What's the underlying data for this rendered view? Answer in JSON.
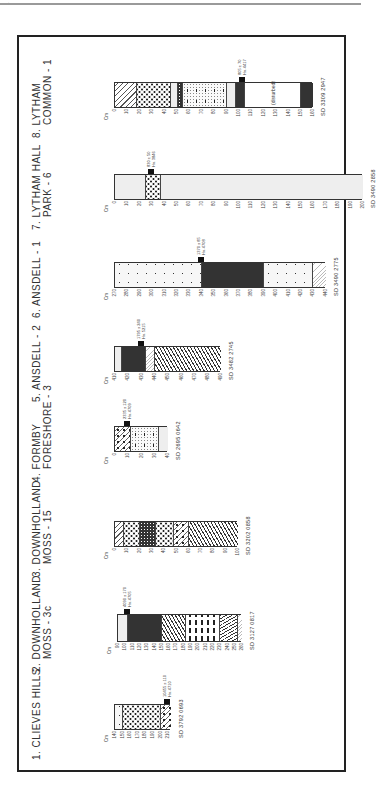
{
  "page": {
    "page_mark": "·"
  },
  "figure": {
    "type": "stratigraphic-columns",
    "depth_unit": "Cm",
    "sites": [
      {
        "number": "1.",
        "name_line1": "CLIEVES HILLS",
        "name_line2": "",
        "grid_ref": "SD 3792 0693",
        "depth_ticks": [
          "140",
          "150",
          "160",
          "170",
          "180",
          "190",
          "200",
          "210"
        ],
        "date": {
          "age": "10455 ± 110",
          "lab": "Hv. 4710"
        },
        "layers": [
          {
            "from": 140,
            "to": 150,
            "pattern": "dots"
          },
          {
            "from": 150,
            "to": 200,
            "pattern": "circles"
          },
          {
            "from": 200,
            "to": 214,
            "pattern": "mixed"
          }
        ]
      },
      {
        "number": "2.",
        "name_line1": "DOWNHOLLAND",
        "name_line2": "MOSS - 3c",
        "grid_ref": "SD 3127 0817",
        "depth_ticks": [
          "90",
          "100",
          "110",
          "120",
          "130",
          "140",
          "150",
          "160",
          "170",
          "180",
          "190",
          "200",
          "210",
          "220",
          "230",
          "240",
          "250",
          "260"
        ],
        "date": {
          "age": "4090 ± 170",
          "lab": "Hv. 4705"
        },
        "layers": [
          {
            "from": 90,
            "to": 104,
            "pattern": "stipple"
          },
          {
            "from": 104,
            "to": 150,
            "pattern": "dense"
          },
          {
            "from": 150,
            "to": 183,
            "pattern": "wave"
          },
          {
            "from": 183,
            "to": 230,
            "pattern": "dash"
          },
          {
            "from": 230,
            "to": 255,
            "pattern": "zig"
          },
          {
            "from": 255,
            "to": 260,
            "pattern": "light"
          }
        ]
      },
      {
        "number": "3.",
        "name_line1": "DOWNHOLLAND",
        "name_line2": "MOSS - 15",
        "grid_ref": "SD 3202 0858",
        "depth_ticks": [
          "0",
          "10",
          "20",
          "30",
          "40",
          "50",
          "60",
          "70",
          "80",
          "90",
          "100"
        ],
        "date": null,
        "layers": [
          {
            "from": 0,
            "to": 7,
            "pattern": "diag"
          },
          {
            "from": 7,
            "to": 20,
            "pattern": "circles"
          },
          {
            "from": 20,
            "to": 33,
            "pattern": "black"
          },
          {
            "from": 33,
            "to": 48,
            "pattern": "circles"
          },
          {
            "from": 48,
            "to": 60,
            "pattern": "mixed"
          },
          {
            "from": 60,
            "to": 100,
            "pattern": "wave"
          }
        ]
      },
      {
        "number": "4.",
        "name_line1": "FORMBY",
        "name_line2": "FORESHORE - 3",
        "grid_ref": "SD 2695 0642",
        "depth_ticks": [
          "0",
          "10",
          "20",
          "30",
          "40"
        ],
        "date": {
          "age": "2335 ± 120",
          "lab": "Hv. 4709"
        },
        "layers": [
          {
            "from": 0,
            "to": 12,
            "pattern": "mixed"
          },
          {
            "from": 12,
            "to": 33,
            "pattern": "sparse"
          },
          {
            "from": 33,
            "to": 40,
            "pattern": "stipple"
          }
        ]
      },
      {
        "number": "5.",
        "name_line1": "ANSDELL - 2",
        "name_line2": "",
        "grid_ref": "SD 3482 2745",
        "depth_ticks": [
          "410",
          "420",
          "430",
          "440",
          "450",
          "460",
          "470",
          "480",
          "490"
        ],
        "date": {
          "age": "1795 ± 240",
          "lab": "Hv. 5215"
        },
        "layers": [
          {
            "from": 410,
            "to": 415,
            "pattern": "stipple"
          },
          {
            "from": 415,
            "to": 433,
            "pattern": "dense"
          },
          {
            "from": 433,
            "to": 440,
            "pattern": "light"
          },
          {
            "from": 440,
            "to": 490,
            "pattern": "wave"
          }
        ]
      },
      {
        "number": "6.",
        "name_line1": "ANSDELL - 1",
        "name_line2": "",
        "grid_ref": "SD 3490 2775",
        "depth_ticks": [
          "270",
          "280",
          "290",
          "300",
          "310",
          "320",
          "330",
          "340",
          "350",
          "360",
          "370",
          "380",
          "390",
          "400",
          "410",
          "420",
          "430",
          "440"
        ],
        "date": {
          "age": "1370 ± 85",
          "lab": "Hv. 4708"
        },
        "layers": [
          {
            "from": 270,
            "to": 340,
            "pattern": "dots"
          },
          {
            "from": 340,
            "to": 390,
            "pattern": "dense"
          },
          {
            "from": 390,
            "to": 430,
            "pattern": "dots"
          },
          {
            "from": 430,
            "to": 440,
            "pattern": "light"
          }
        ]
      },
      {
        "number": "7.",
        "name_line1": "LYTHAM HALL",
        "name_line2": "PARK - 6",
        "grid_ref": "SD 3490 2858",
        "depth_ticks": [
          "0",
          "10",
          "20",
          "30",
          "40",
          "50",
          "60",
          "70",
          "80",
          "90",
          "100",
          "110",
          "120",
          "130",
          "140",
          "150",
          "160",
          "170",
          "180",
          "190",
          "200"
        ],
        "date": {
          "age": "830 ± 50",
          "lab": "Hv. 3846"
        },
        "layers": [
          {
            "from": 0,
            "to": 25,
            "pattern": "stipple"
          },
          {
            "from": 25,
            "to": 37,
            "pattern": "circles"
          },
          {
            "from": 37,
            "to": 200,
            "pattern": "stipple"
          }
        ]
      },
      {
        "number": "8.",
        "name_line1": "LYTHAM",
        "name_line2": "COMMON - 1",
        "grid_ref": "SD 3309 2947",
        "depth_ticks": [
          "0",
          "10",
          "20",
          "30",
          "40",
          "50",
          "60",
          "70",
          "80",
          "90",
          "100",
          "110",
          "120",
          "130",
          "140",
          "150",
          "160"
        ],
        "date": {
          "age": "805 ± 70",
          "lab": "Hv. 4417"
        },
        "layers": [
          {
            "from": 0,
            "to": 18,
            "pattern": "diag"
          },
          {
            "from": 18,
            "to": 45,
            "pattern": "circles"
          },
          {
            "from": 45,
            "to": 51,
            "pattern": "stipple"
          },
          {
            "from": 51,
            "to": 55,
            "pattern": "black"
          },
          {
            "from": 55,
            "to": 90,
            "pattern": "sparse"
          },
          {
            "from": 90,
            "to": 98,
            "pattern": "stipple"
          },
          {
            "from": 98,
            "to": 105,
            "pattern": "dense"
          },
          {
            "from": 105,
            "to": 150,
            "pattern": "plain",
            "label": "(disturbed)"
          },
          {
            "from": 150,
            "to": 160,
            "pattern": "dense"
          }
        ]
      }
    ]
  }
}
